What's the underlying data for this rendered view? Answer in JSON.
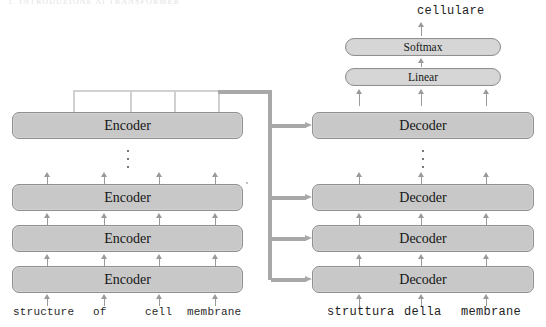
{
  "page": {
    "header_text": "1. INTRODUZIONE AI TRANSFORMER"
  },
  "diagram": {
    "colors": {
      "block_fill": "#c8c8c8",
      "block_border": "#8f8f8f",
      "small_block_fill": "#d6d6d6",
      "bus": "#a8a8a8",
      "thin_connector": "#d0d0d0",
      "arrow": "#9a9a9a",
      "text": "#161616",
      "background": "#ffffff"
    },
    "output_token": "cellulare",
    "head": {
      "softmax_label": "Softmax",
      "linear_label": "Linear"
    },
    "encoder": {
      "label": "Encoder",
      "layers": [
        {
          "label": "Encoder"
        },
        {
          "label": "Encoder"
        },
        {
          "label": "Encoder"
        }
      ],
      "ellipsis": "⋮",
      "input_tokens": [
        "structure",
        "of",
        "cell",
        "membrane"
      ]
    },
    "decoder": {
      "label": "Decoder",
      "layers": [
        {
          "label": "Decoder"
        },
        {
          "label": "Decoder"
        },
        {
          "label": "Decoder"
        },
        {
          "label": "Decoder"
        }
      ],
      "ellipsis": "⋮",
      "input_tokens": [
        "struttura",
        "della",
        "membrane"
      ]
    },
    "cross_attention_arrows": 4
  }
}
